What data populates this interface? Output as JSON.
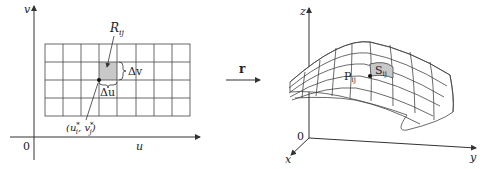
{
  "left_panel": {
    "axis_v_label": "v",
    "axis_u_label": "u",
    "origin_label": "0",
    "region_label_main": "R",
    "region_label_sub": "ij",
    "delta_v_label": "Δv",
    "delta_u_label": "Δu",
    "sample_point_label": "(u",
    "sample_point_u_sub": "i",
    "sample_point_u_sup": "*",
    "sample_point_mid": ", v",
    "sample_point_v_sub": "j",
    "sample_point_v_sup": "*",
    "sample_point_close": ")",
    "grid": {
      "columns": 8,
      "rows": 4,
      "highlight_col": 4,
      "highlight_row": 2
    }
  },
  "mapping": {
    "label": "r"
  },
  "right_panel": {
    "axis_z_label": "z",
    "axis_y_label": "y",
    "axis_x_label": "x",
    "origin_label": "0",
    "point_label_main": "P",
    "point_label_sub": "ij",
    "patch_label_main": "S",
    "patch_label_sub": "ij"
  },
  "colors": {
    "line": "#333333",
    "grid_line": "#444444",
    "highlight_fill": "#c8c8c8"
  }
}
